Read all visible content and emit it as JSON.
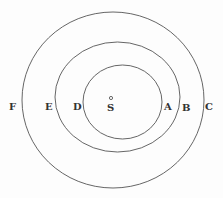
{
  "diagram": {
    "center_label": "S",
    "circles": [
      {
        "name": "inner",
        "cx": 123,
        "cy": 102,
        "rx": 40,
        "ry": 37
      },
      {
        "name": "middle",
        "cx": 117.5,
        "cy": 97,
        "rx": 62.5,
        "ry": 55
      },
      {
        "name": "outer",
        "cx": 113,
        "cy": 100,
        "rx": 91,
        "ry": 88
      }
    ],
    "labels": {
      "F": "F",
      "E": "E",
      "D": "D",
      "A": "A",
      "B": "B",
      "C": "C"
    },
    "line_color": "#555555"
  }
}
